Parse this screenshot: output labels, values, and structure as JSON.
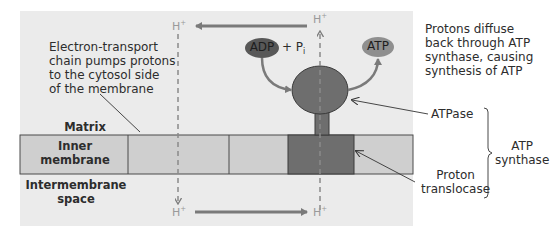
{
  "diagram": {
    "title_hidden": "",
    "annotations": {
      "etc_note": [
        "Electron-transport",
        "chain pumps protons",
        "to the cytosol side",
        "of the membrane"
      ],
      "diffuse_note": [
        "Protons diffuse",
        "back through ATP",
        "synthase, causing",
        "synthesis of ATP"
      ]
    },
    "regions": {
      "matrix": "Matrix",
      "inner_membrane": [
        "Inner",
        "membrane"
      ],
      "intermembrane": [
        "Intermembrane",
        "space"
      ]
    },
    "molecules": {
      "adp": "ADP",
      "pi_prefix": "+ P",
      "pi_sub": "i",
      "atp": "ATP",
      "proton": "H",
      "proton_charge": "+"
    },
    "components": {
      "atpase": "ATPase",
      "proton_translocase": [
        "Proton",
        "translocase"
      ],
      "atp_synthase": [
        "ATP",
        "synthase"
      ]
    },
    "colors": {
      "panel_bg": "#ebebeb",
      "membrane": "#cfcfcf",
      "dark_protein": "#6e6e6e",
      "adp_fill": "#585858",
      "atp_fill": "#8f8f8f",
      "arrow": "#7a7a7a",
      "proton_text": "#9a9a9a"
    }
  }
}
